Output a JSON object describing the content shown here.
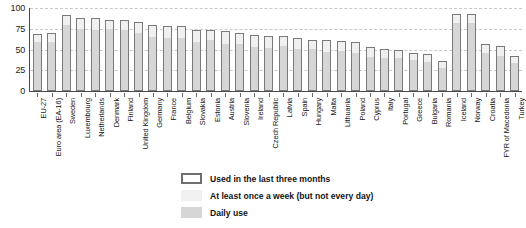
{
  "chart_data": {
    "type": "bar",
    "title": "",
    "subtitle": "",
    "xlabel": "",
    "ylabel": "",
    "ylim": [
      0,
      100
    ],
    "yticks": [
      0,
      25,
      50,
      75,
      100
    ],
    "grid": true,
    "stacked": true,
    "legend_position": "bottom-center",
    "categories": [
      "EU-27",
      "Euro area (EA-16)",
      "Sweden",
      "Luxembourg",
      "Netherlands",
      "Denmark",
      "Finland",
      "United Kingdom",
      "Germany",
      "France",
      "Belgium",
      "Slovakia",
      "Estonia",
      "Austria",
      "Slovenia",
      "Ireland",
      "Czech Republic",
      "Latvia",
      "Spain",
      "Hungary",
      "Malta",
      "Lithuania",
      "Poland",
      "Cyprus",
      "Italy",
      "Portugal",
      "Greece",
      "Bulgaria",
      "Romania",
      "Iceland",
      "Norway",
      "Croatia",
      "FYR of Macedonia",
      "Turkey"
    ],
    "series": [
      {
        "name": "Used in the last three months",
        "color": "#7a7a7a",
        "values": [
          69,
          70,
          91,
          88,
          88,
          86,
          86,
          83,
          79,
          78,
          78,
          74,
          73,
          72,
          70,
          67,
          66,
          66,
          64,
          62,
          61,
          60,
          59,
          53,
          51,
          49,
          46,
          44,
          36,
          93,
          93,
          57,
          54,
          42
        ]
      },
      {
        "name": "At least once a week (but not every day)",
        "color": "#f0f0f0",
        "values": [
          11,
          12,
          13,
          14,
          16,
          13,
          14,
          14,
          15,
          15,
          15,
          16,
          13,
          16,
          15,
          15,
          15,
          13,
          14,
          13,
          15,
          13,
          14,
          13,
          12,
          11,
          10,
          10,
          9,
          12,
          12,
          13,
          13,
          10
        ]
      },
      {
        "name": "Daily use",
        "color": "#d6d6d6",
        "values": [
          58,
          58,
          78,
          74,
          72,
          73,
          72,
          69,
          64,
          63,
          63,
          58,
          60,
          56,
          55,
          52,
          51,
          53,
          50,
          49,
          46,
          47,
          45,
          40,
          39,
          38,
          36,
          34,
          27,
          81,
          81,
          44,
          41,
          32
        ]
      }
    ]
  },
  "axis": {
    "y_tick_labels": [
      "100",
      "75",
      "50",
      "25",
      "0"
    ]
  },
  "legend": {
    "items": [
      {
        "label": "Used in the last three months",
        "swatch": "outline-box-icon"
      },
      {
        "label": "At least once a week (but not every day)",
        "swatch": "light-swatch-icon"
      },
      {
        "label": "Daily use",
        "swatch": "gray-swatch-icon"
      }
    ]
  }
}
